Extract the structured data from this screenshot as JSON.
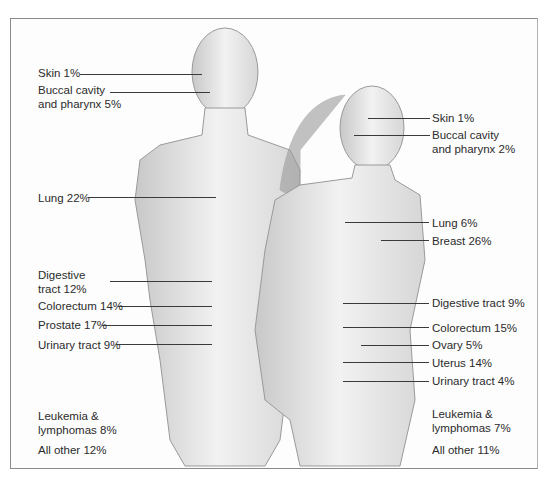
{
  "figure": {
    "male": {
      "labels": [
        {
          "id": "skin",
          "text": "Skin 1%"
        },
        {
          "id": "buccal",
          "line1": "Buccal cavity",
          "line2": "and pharynx 5%"
        },
        {
          "id": "lung",
          "text": "Lung 22%"
        },
        {
          "id": "digestive",
          "line1": "Digestive",
          "line2": "tract 12%"
        },
        {
          "id": "colorectum",
          "text": "Colorectum 14%"
        },
        {
          "id": "prostate",
          "text": "Prostate 17%"
        },
        {
          "id": "urinary",
          "text": "Urinary tract 9%"
        },
        {
          "id": "leukemia",
          "line1": "Leukemia &",
          "line2": "lymphomas 8%"
        },
        {
          "id": "other",
          "text": "All other 12%"
        }
      ]
    },
    "female": {
      "labels": [
        {
          "id": "skin",
          "text": "Skin 1%"
        },
        {
          "id": "buccal",
          "line1": "Buccal cavity",
          "line2": "and pharynx 2%"
        },
        {
          "id": "lung",
          "text": "Lung 6%"
        },
        {
          "id": "breast",
          "text": "Breast 26%"
        },
        {
          "id": "digestive",
          "text": "Digestive tract 9%"
        },
        {
          "id": "colorectum",
          "text": "Colorectum 15%"
        },
        {
          "id": "ovary",
          "text": "Ovary 5%"
        },
        {
          "id": "uterus",
          "text": "Uterus 14%"
        },
        {
          "id": "urinary",
          "text": "Urinary tract 4%"
        },
        {
          "id": "leukemia",
          "line1": "Leukemia &",
          "line2": "lymphomas 7%"
        },
        {
          "id": "other",
          "text": "All other 11%"
        }
      ]
    },
    "colors": {
      "ink": "#2b2b2b",
      "leader": "#3a3a3a",
      "sketch": "#9a9a9a",
      "frame": "#8a8a8a"
    }
  }
}
